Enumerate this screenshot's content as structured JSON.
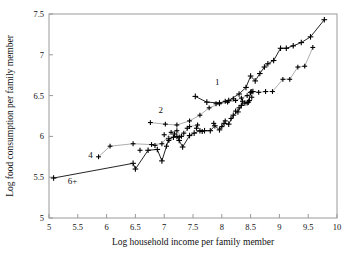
{
  "chart_data": {
    "type": "scatter",
    "title": "",
    "xlabel": "Log household income per family member",
    "ylabel": "Log food consumption per family member",
    "xlim": [
      5,
      10
    ],
    "ylim": [
      5,
      7.5
    ],
    "xticks": [
      "5",
      "5.5",
      "6",
      "6.5",
      "7",
      "7.5",
      "8",
      "8.5",
      "9",
      "9.5",
      "10"
    ],
    "xtick_values": [
      5,
      5.5,
      6,
      6.5,
      7,
      7.5,
      8,
      8.5,
      9,
      9.5,
      10
    ],
    "yticks": [
      "5",
      "5.5",
      "6",
      "6.5",
      "7",
      "7.5"
    ],
    "ytick_values": [
      5,
      5.5,
      6,
      6.5,
      7,
      7.5
    ],
    "grid": false,
    "legend_position": "inline-annotations",
    "marker": "plus",
    "marker_color": "#000000",
    "line_color": "#333333",
    "frame_color": "#9a9a9a",
    "background": "#ffffff",
    "annotations": [
      {
        "label": "1",
        "x": 7.92,
        "y": 6.63
      },
      {
        "label": "2",
        "x": 6.94,
        "y": 6.29
      },
      {
        "label": "4",
        "x": 5.72,
        "y": 5.73
      },
      {
        "label": "6+",
        "x": 5.41,
        "y": 5.42
      }
    ],
    "series": [
      {
        "name": "1",
        "label": "1",
        "line_weight": "heavy",
        "points": [
          [
            7.54,
            6.49
          ],
          [
            7.74,
            6.42
          ],
          [
            7.96,
            6.41
          ],
          [
            8.12,
            6.44
          ],
          [
            8.3,
            6.52
          ],
          [
            8.42,
            6.6
          ],
          [
            8.5,
            6.74
          ],
          [
            8.58,
            6.68
          ],
          [
            8.66,
            6.77
          ],
          [
            8.74,
            6.85
          ],
          [
            8.8,
            6.89
          ],
          [
            8.9,
            6.93
          ],
          [
            9.02,
            7.08
          ],
          [
            9.12,
            7.08
          ],
          [
            9.24,
            7.11
          ],
          [
            9.38,
            7.15
          ],
          [
            9.54,
            7.22
          ],
          [
            9.78,
            7.43
          ]
        ]
      },
      {
        "name": "2",
        "label": "2",
        "line_weight": "light",
        "points": [
          [
            6.76,
            6.17
          ],
          [
            7.02,
            6.15
          ],
          [
            7.22,
            6.14
          ],
          [
            7.44,
            6.19
          ],
          [
            7.62,
            6.26
          ],
          [
            7.78,
            6.35
          ],
          [
            7.96,
            6.4
          ],
          [
            8.1,
            6.42
          ],
          [
            8.24,
            6.44
          ],
          [
            8.34,
            6.47
          ],
          [
            8.44,
            6.5
          ],
          [
            8.52,
            6.55
          ],
          [
            8.64,
            6.54
          ],
          [
            8.76,
            6.55
          ],
          [
            8.88,
            6.55
          ],
          [
            9.06,
            6.7
          ],
          [
            9.18,
            6.7
          ],
          [
            9.32,
            6.85
          ],
          [
            9.44,
            6.86
          ],
          [
            9.58,
            7.09
          ]
        ]
      },
      {
        "name": "4",
        "label": "4",
        "line_weight": "light",
        "points": [
          [
            5.86,
            5.75
          ],
          [
            6.06,
            5.88
          ],
          [
            6.46,
            5.91
          ],
          [
            6.78,
            5.9
          ],
          [
            6.96,
            5.91
          ],
          [
            7.12,
            6.05
          ],
          [
            7.22,
            6.07
          ],
          [
            7.3,
            6.0
          ],
          [
            7.44,
            6.12
          ],
          [
            7.58,
            6.14
          ]
        ]
      },
      {
        "name": "6+",
        "label": "6+",
        "line_weight": "heavy",
        "points": [
          [
            5.08,
            5.49
          ],
          [
            6.46,
            5.67
          ],
          [
            6.5,
            5.6
          ],
          [
            6.72,
            5.83
          ],
          [
            6.88,
            5.84
          ],
          [
            6.96,
            5.7
          ],
          [
            7.08,
            5.97
          ],
          [
            7.16,
            5.99
          ],
          [
            7.22,
            6.0
          ],
          [
            7.26,
            5.95
          ],
          [
            7.32,
            5.87
          ],
          [
            7.44,
            6.01
          ],
          [
            7.52,
            6.04
          ],
          [
            7.62,
            6.07
          ],
          [
            7.7,
            6.07
          ],
          [
            7.8,
            6.07
          ],
          [
            7.88,
            6.13
          ],
          [
            7.96,
            6.08
          ],
          [
            8.04,
            6.16
          ],
          [
            8.12,
            6.15
          ],
          [
            8.2,
            6.26
          ],
          [
            8.28,
            6.3
          ],
          [
            8.34,
            6.38
          ],
          [
            8.4,
            6.41
          ],
          [
            8.46,
            6.42
          ],
          [
            8.5,
            6.54
          ],
          [
            8.54,
            6.55
          ]
        ]
      }
    ],
    "extra_points": [
      [
        7.04,
        5.88
      ],
      [
        7.08,
        5.95
      ],
      [
        7.18,
        6.03
      ],
      [
        7.26,
        5.99
      ],
      [
        7.34,
        6.04
      ],
      [
        7.4,
        6.1
      ],
      [
        7.56,
        6.1
      ],
      [
        7.66,
        6.06
      ],
      [
        7.86,
        6.16
      ],
      [
        8.0,
        6.12
      ],
      [
        8.06,
        6.19
      ],
      [
        8.16,
        6.22
      ],
      [
        8.24,
        6.31
      ],
      [
        8.3,
        6.35
      ],
      [
        8.36,
        6.43
      ],
      [
        8.44,
        6.41
      ],
      [
        8.48,
        6.44
      ],
      [
        8.52,
        6.48
      ],
      [
        7.9,
        6.4
      ],
      [
        8.06,
        6.43
      ],
      [
        8.2,
        6.46
      ],
      [
        6.58,
        5.83
      ],
      [
        6.84,
        5.89
      ],
      [
        7.0,
        6.02
      ]
    ]
  }
}
